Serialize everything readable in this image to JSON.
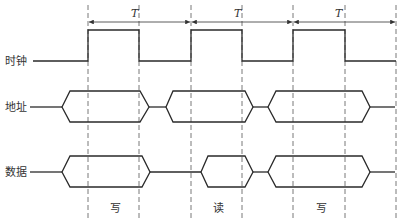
{
  "signals": [
    {
      "label": "时钟",
      "y": 61
    },
    {
      "label": "地址",
      "y": 107
    },
    {
      "label": "数据",
      "y": 172
    }
  ],
  "period_label": "T",
  "cycles": [
    {
      "op": "写"
    },
    {
      "op": "读"
    },
    {
      "op": "写"
    }
  ],
  "colors": {
    "line": "#2a2a2a",
    "dash": "#555555",
    "text": "#333333"
  }
}
